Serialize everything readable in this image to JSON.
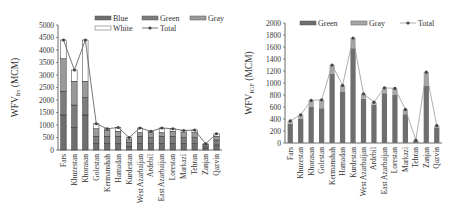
{
  "chart_data": [
    {
      "type": "bar",
      "stacked": true,
      "title": "",
      "xlabel": "",
      "ylabel": "WFV_Irr (MCM)",
      "ylabel_main": "WFV",
      "ylabel_sub": "Irr",
      "ylabel_unit": " (MCM)",
      "ylim": [
        0,
        5000
      ],
      "yticks": [
        0,
        500,
        1000,
        1500,
        2000,
        2500,
        3000,
        3500,
        4000,
        4500,
        5000
      ],
      "grid": false,
      "legend_position": "top",
      "legend": [
        "Blue",
        "Green",
        "Gray",
        "White",
        "Total"
      ],
      "categories": [
        "Fars",
        "Khuzestan",
        "Khorasan",
        "Golestan",
        "Kermanshah",
        "Hamadan",
        "Kurdestan",
        "West Azarbaijan",
        "Ardebil",
        "East Azarbaijan",
        "Lorestan",
        "Markazi",
        "Tehran",
        "Zanjan",
        "Qazvin"
      ],
      "series": [
        {
          "name": "Blue",
          "values": [
            1400,
            900,
            1400,
            250,
            250,
            250,
            150,
            250,
            250,
            250,
            250,
            250,
            250,
            80,
            200
          ],
          "color": "#6e6e6e"
        },
        {
          "name": "Green",
          "values": [
            950,
            900,
            700,
            300,
            300,
            300,
            150,
            300,
            250,
            300,
            300,
            250,
            250,
            80,
            200
          ],
          "color": "#7c7c7c"
        },
        {
          "name": "Gray",
          "values": [
            1300,
            950,
            650,
            300,
            250,
            200,
            120,
            150,
            200,
            150,
            200,
            200,
            200,
            70,
            150
          ],
          "color": "#9a9a9a"
        },
        {
          "name": "White",
          "values": [
            750,
            450,
            1650,
            200,
            50,
            150,
            80,
            180,
            50,
            180,
            100,
            80,
            100,
            20,
            100
          ],
          "color": "#ffffff"
        },
        {
          "name": "Total",
          "type": "line",
          "values": [
            4400,
            3200,
            4400,
            1050,
            850,
            900,
            500,
            880,
            750,
            880,
            850,
            780,
            800,
            250,
            650
          ],
          "color": "#555555"
        }
      ]
    },
    {
      "type": "bar",
      "stacked": true,
      "title": "",
      "xlabel": "",
      "ylabel": "WFV_IGF (MCM)",
      "ylabel_main": "WFV",
      "ylabel_sub": "IGF",
      "ylabel_unit": " (MCM)",
      "ylim": [
        0,
        2000
      ],
      "yticks": [
        0,
        200,
        400,
        600,
        800,
        1000,
        1200,
        1400,
        1600,
        1800,
        2000
      ],
      "grid": false,
      "legend_position": "top",
      "legend": [
        "Green",
        "Gray",
        "Total"
      ],
      "categories": [
        "Fars",
        "Khuzestan",
        "Khorasan",
        "Golestan",
        "Kermanshah",
        "Hamadan",
        "Kurdestan",
        "West Azarbaijan",
        "Ardebil",
        "East Azarbaijan",
        "Lorestan",
        "Markazi",
        "Tehran",
        "Zanjan",
        "Qazvin"
      ],
      "series": [
        {
          "name": "Green",
          "values": [
            320,
            400,
            600,
            580,
            1150,
            850,
            1580,
            740,
            640,
            830,
            800,
            480,
            40,
            950,
            260
          ],
          "color": "#6e6e6e"
        },
        {
          "name": "Gray",
          "values": [
            50,
            70,
            110,
            140,
            150,
            110,
            170,
            80,
            40,
            90,
            110,
            80,
            10,
            230,
            30
          ],
          "color": "#a8a8a8"
        },
        {
          "name": "Total",
          "type": "line",
          "values": [
            370,
            470,
            710,
            720,
            1300,
            960,
            1750,
            820,
            680,
            920,
            910,
            560,
            50,
            1180,
            290
          ],
          "color": "#999999"
        }
      ]
    }
  ]
}
